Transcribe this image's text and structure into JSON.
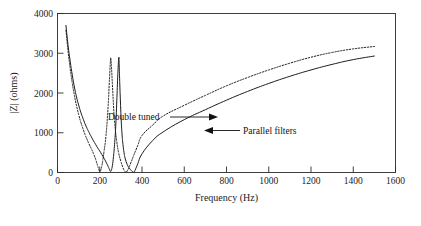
{
  "chart_data": {
    "type": "line",
    "title": "",
    "xlabel": "Frequency (Hz)",
    "ylabel": "|Z| (ohms)",
    "xlim": [
      0,
      1600
    ],
    "ylim": [
      0,
      4000
    ],
    "xticks": [
      0,
      200,
      400,
      600,
      800,
      1000,
      1200,
      1400,
      1600
    ],
    "yticks": [
      0,
      1000,
      2000,
      3000,
      4000
    ],
    "xtick_labels": [
      "0",
      "200",
      "400",
      "600",
      "800",
      "1000",
      "1200",
      "1400",
      "1600"
    ],
    "ytick_labels": [
      "0",
      "1000",
      "2000",
      "3000",
      "4000"
    ],
    "grid": false,
    "legend_position": "inline-annotations",
    "series": [
      {
        "name": "Parallel filters",
        "style": "solid",
        "color": "#1c1c1c",
        "x": [
          40,
          50,
          60,
          70,
          80,
          90,
          100,
          110,
          120,
          130,
          140,
          150,
          160,
          170,
          180,
          190,
          200,
          210,
          220,
          230,
          240,
          245,
          250,
          255,
          260,
          265,
          270,
          275,
          280,
          285,
          290,
          292,
          295,
          300,
          305,
          310,
          315,
          320,
          330,
          340,
          350,
          355,
          360,
          365,
          370,
          380,
          400,
          450,
          500,
          600,
          700,
          800,
          900,
          1000,
          1100,
          1200,
          1300,
          1400,
          1500
        ],
        "y": [
          3700,
          3200,
          2800,
          2450,
          2150,
          1900,
          1700,
          1520,
          1370,
          1230,
          1110,
          1000,
          900,
          800,
          710,
          620,
          540,
          450,
          360,
          260,
          150,
          90,
          30,
          60,
          180,
          400,
          700,
          1100,
          1700,
          2400,
          2880,
          2700,
          2200,
          1500,
          1000,
          700,
          500,
          360,
          200,
          110,
          45,
          20,
          5,
          30,
          90,
          220,
          470,
          800,
          1020,
          1330,
          1580,
          1820,
          2040,
          2240,
          2420,
          2580,
          2720,
          2840,
          2930
        ]
      },
      {
        "name": "Double tuned",
        "style": "dotted",
        "color": "#1c1c1c",
        "x": [
          40,
          50,
          60,
          70,
          80,
          90,
          100,
          110,
          120,
          130,
          140,
          150,
          160,
          170,
          180,
          190,
          195,
          200,
          205,
          210,
          215,
          220,
          230,
          240,
          245,
          250,
          252,
          255,
          260,
          265,
          270,
          280,
          290,
          300,
          310,
          315,
          320,
          325,
          330,
          340,
          360,
          380,
          400,
          450,
          500,
          600,
          700,
          800,
          900,
          1000,
          1100,
          1200,
          1300,
          1400,
          1500
        ],
        "y": [
          3580,
          3050,
          2620,
          2250,
          1940,
          1680,
          1460,
          1270,
          1110,
          960,
          830,
          710,
          600,
          480,
          340,
          170,
          90,
          30,
          60,
          170,
          330,
          520,
          950,
          1700,
          2250,
          2750,
          2880,
          2700,
          2200,
          1700,
          1300,
          800,
          480,
          280,
          120,
          60,
          20,
          10,
          40,
          150,
          420,
          680,
          930,
          1190,
          1420,
          1690,
          1940,
          2180,
          2390,
          2580,
          2750,
          2900,
          3020,
          3110,
          3170
        ]
      }
    ],
    "annotations": [
      {
        "text": "Double tuned",
        "target_series": "Double tuned",
        "arrow_direction": "right"
      },
      {
        "text": "Parallel filters",
        "target_series": "Parallel filters",
        "arrow_direction": "left"
      }
    ]
  },
  "figure": {
    "background_color": "#ffffff",
    "axis_color": "#2b2b2b",
    "line_color": "#1c1c1c"
  }
}
